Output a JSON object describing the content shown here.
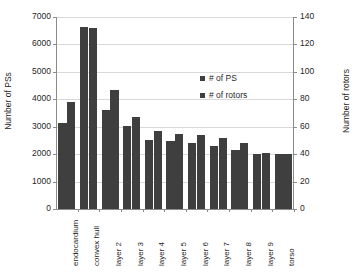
{
  "chart_data": {
    "type": "bar",
    "title": "",
    "categories": [
      "endocardium",
      "convex hull",
      "layer 2",
      "layer 3",
      "layer 4",
      "layer 5",
      "layer 6",
      "layer 7",
      "layer 8",
      "layer 9",
      "torso"
    ],
    "series": [
      {
        "name": "# of PS",
        "axis": "left",
        "values": [
          3150,
          6620,
          3600,
          3020,
          2520,
          2480,
          2420,
          2280,
          2140,
          2000,
          1990
        ]
      },
      {
        "name": "# of rotors",
        "axis": "right",
        "values": [
          78,
          132,
          87,
          67,
          57,
          55,
          54,
          52,
          48,
          41,
          40
        ]
      }
    ],
    "xlabel": "",
    "ylabel_left": "Number of PSs",
    "ylabel_right": "Number of rotors",
    "ylim_left": [
      0,
      7000
    ],
    "ylim_right": [
      0,
      140
    ],
    "yticks_left": [
      0,
      1000,
      2000,
      3000,
      4000,
      5000,
      6000,
      7000
    ],
    "yticks_right": [
      0,
      20,
      40,
      60,
      80,
      100,
      120,
      140
    ],
    "grid": true,
    "legend_position": "inside-upper-right",
    "bar_color": "#3f3f3f",
    "grid_color": "#d9d9d9",
    "axis_color": "#8c8c8c"
  },
  "legend": {
    "entries": [
      {
        "label": "# of PS"
      },
      {
        "label": "# of rotors"
      }
    ]
  }
}
